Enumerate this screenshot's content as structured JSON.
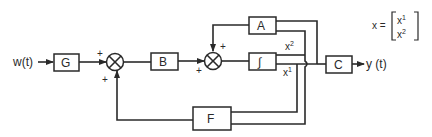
{
  "diagram": {
    "type": "block-diagram",
    "input_label": "w(t)",
    "output_label": "y (t)",
    "blocks": {
      "G": "G",
      "B": "B",
      "A": "A",
      "integrator": "∫",
      "C": "C",
      "F": "F"
    },
    "summing_junctions": [
      {
        "id": "sum1",
        "signs": [
          "+",
          "+"
        ]
      },
      {
        "id": "sum2",
        "signs": [
          "+",
          "+"
        ]
      }
    ],
    "signals": {
      "x2": "x",
      "x2_sup": "2",
      "x1": "x",
      "x1_sup": "1"
    },
    "state_vector": {
      "lhs": "x =",
      "row1": "x",
      "row1_sup": "1",
      "row2": "x",
      "row2_sup": "2"
    },
    "colors": {
      "line": "#2a2a2a",
      "background": "#ffffff"
    }
  }
}
